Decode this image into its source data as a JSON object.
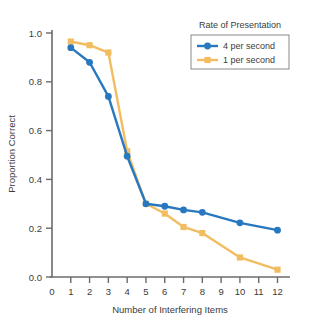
{
  "chart_data": {
    "type": "line",
    "title": "",
    "xlabel": "Number of Interfering Items",
    "ylabel": "Proportion Correct",
    "xlim": [
      0,
      12.6
    ],
    "ylim": [
      0.0,
      1.04
    ],
    "xticks": [
      0,
      1,
      2,
      3,
      4,
      5,
      6,
      7,
      8,
      9,
      10,
      11,
      12
    ],
    "xtick_labels": [
      "0",
      "1",
      "2",
      "3",
      "4",
      "5",
      "6",
      "7",
      "8",
      "9",
      "10",
      "11",
      "12"
    ],
    "yticks": [
      0.0,
      0.2,
      0.4,
      0.6,
      0.8,
      1.0
    ],
    "ytick_labels": [
      "0.0",
      "0.2",
      "0.4",
      "0.6",
      "0.8",
      "1.0"
    ],
    "grid": false,
    "legend_position": "top-right",
    "legend_title": "Rate of Presentation",
    "series": [
      {
        "name": "4 per second",
        "color": "#2878c0",
        "marker": "circle",
        "x": [
          1,
          2,
          3,
          4,
          5,
          6,
          7,
          8,
          10,
          12
        ],
        "values": [
          0.94,
          0.88,
          0.74,
          0.495,
          0.3,
          0.29,
          0.275,
          0.265,
          0.222,
          0.192
        ]
      },
      {
        "name": "1 per second",
        "color": "#f2bd61",
        "marker": "square",
        "x": [
          1,
          2,
          3,
          4,
          5,
          6,
          7,
          8,
          10,
          12
        ],
        "values": [
          0.965,
          0.95,
          0.92,
          0.515,
          0.3,
          0.26,
          0.205,
          0.18,
          0.08,
          0.03
        ]
      }
    ]
  },
  "legend": {
    "title": "Rate of Presentation",
    "entries": [
      {
        "label": "4 per second",
        "color": "#2878c0",
        "marker": "circle"
      },
      {
        "label": "1 per second",
        "color": "#f2bd61",
        "marker": "square"
      }
    ]
  },
  "axes": {
    "x_title": "Number of Interfering Items",
    "y_title": "Proportion Correct",
    "axis_color": "#6b6b6b",
    "text_color": "#3b3b3b"
  }
}
